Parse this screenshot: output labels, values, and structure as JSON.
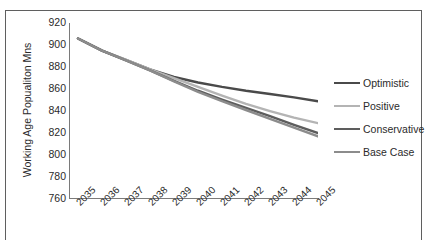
{
  "chart_data": {
    "type": "line",
    "title": "",
    "xlabel": "",
    "ylabel": "Working Age Popualiton Mns",
    "categories": [
      "2035",
      "2036",
      "2037",
      "2038",
      "2039",
      "2040",
      "2041",
      "2042",
      "2043",
      "2044",
      "2045"
    ],
    "ylim": [
      760,
      920
    ],
    "ytick_step": 20,
    "yticks": [
      920,
      900,
      880,
      860,
      840,
      820,
      800,
      780,
      760
    ],
    "grid": false,
    "legend_position": "right",
    "series": [
      {
        "name": "Optimistic",
        "color": "#4a4a4a",
        "values": [
          905,
          894,
          885.5,
          877,
          870,
          865,
          861,
          857.5,
          854.5,
          851.5,
          848
        ]
      },
      {
        "name": "Positive",
        "color": "#b4b4b4",
        "values": [
          905,
          894,
          885.5,
          877,
          869,
          861,
          853,
          845.5,
          839,
          833,
          828
        ]
      },
      {
        "name": "Conservative",
        "color": "#5d5d5d",
        "values": [
          905,
          894,
          885,
          876,
          866.5,
          857.5,
          849.5,
          842,
          834.5,
          826.5,
          819
        ]
      },
      {
        "name": "Base Case",
        "color": "#8c8c8c",
        "values": [
          905,
          894,
          885,
          876,
          866,
          856.5,
          848,
          840,
          832,
          824,
          816
        ]
      }
    ]
  },
  "legend": {
    "items": [
      {
        "label": "Optimistic"
      },
      {
        "label": "Positive"
      },
      {
        "label": "Conservative"
      },
      {
        "label": "Base Case"
      }
    ]
  }
}
